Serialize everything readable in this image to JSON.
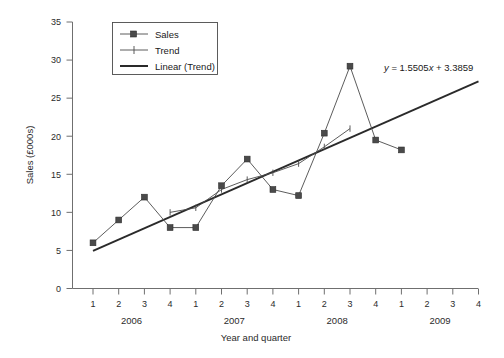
{
  "chart_data": {
    "type": "line",
    "title": "",
    "xlabel": "Year and quarter",
    "ylabel": "Sales (£000s)",
    "ylim": [
      0,
      35
    ],
    "ytick_step": 5,
    "yticks": [
      "0",
      "5",
      "10",
      "15",
      "20",
      "25",
      "30",
      "35"
    ],
    "grid": false,
    "legend_position": "top-left",
    "x": [
      1,
      2,
      3,
      4,
      5,
      6,
      7,
      8,
      9,
      10,
      11,
      12,
      13
    ],
    "categories": [
      "1",
      "2",
      "3",
      "4",
      "1",
      "2",
      "3",
      "4",
      "1",
      "2",
      "3",
      "4",
      "1",
      "2",
      "3",
      "4"
    ],
    "xtick_labels": [
      "1",
      "2",
      "3",
      "4",
      "1",
      "2",
      "3",
      "4",
      "1",
      "2",
      "3",
      "4",
      "1",
      "2",
      "3",
      "4"
    ],
    "year_groups": [
      {
        "label": "2006",
        "quarters": [
          "1",
          "2",
          "3",
          "4"
        ]
      },
      {
        "label": "2007",
        "quarters": [
          "1",
          "2",
          "3",
          "4"
        ]
      },
      {
        "label": "2008",
        "quarters": [
          "1",
          "2",
          "3",
          "4"
        ]
      },
      {
        "label": "2009",
        "quarters": [
          "1",
          "2",
          "3",
          "4"
        ]
      }
    ],
    "series": [
      {
        "name": "Sales",
        "marker": "square",
        "x": [
          1,
          2,
          3,
          4,
          5,
          6,
          7,
          8,
          9,
          10,
          11,
          12,
          13
        ],
        "values": [
          6.0,
          9.0,
          12.0,
          8.0,
          8.0,
          13.5,
          17.0,
          13.0,
          12.2,
          20.4,
          29.2,
          19.5,
          18.2
        ]
      },
      {
        "name": "Trend",
        "marker": "plus",
        "x": [
          4,
          5,
          6,
          7,
          8,
          9,
          10,
          11
        ],
        "values": [
          10.0,
          10.6,
          13.0,
          14.3,
          15.2,
          16.4,
          18.6,
          21.0
        ]
      },
      {
        "name": "Linear (Trend)",
        "marker": "none",
        "x": [
          1,
          16
        ],
        "values": [
          4.94,
          27.2
        ]
      }
    ],
    "annotations": [
      {
        "text": "y = 1.5505x + 3.3859",
        "x": 11.7,
        "y": 30.0,
        "slope": 1.5505,
        "intercept": 3.3859
      }
    ],
    "legend": [
      {
        "label": "Sales",
        "style": "line-square"
      },
      {
        "label": "Trend",
        "style": "line-plus"
      },
      {
        "label": "Linear (Trend)",
        "style": "line-plain"
      }
    ]
  }
}
